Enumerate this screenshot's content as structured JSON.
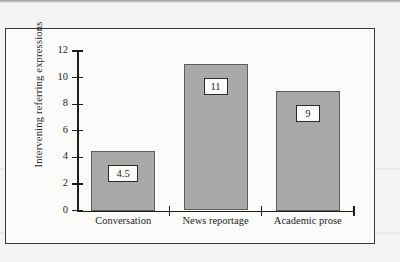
{
  "figure": {
    "colors": {
      "bar_fill": "#a9a9a7",
      "bar_edge": "#5d5d5b",
      "axis": "#1d1d1b",
      "frame": "#3a3a38",
      "plot_background": "#fbfbf9",
      "page_background": "#f4f4f2",
      "value_box_background": "#fdfdfb"
    }
  },
  "chart_data": {
    "type": "bar",
    "title": "",
    "subtitle": "",
    "xlabel": "",
    "ylabel": "Intervening referring expressions",
    "categories": [
      "Conversation",
      "News reportage",
      "Academic prose"
    ],
    "values": [
      4.5,
      11,
      9
    ],
    "value_labels": [
      "4.5",
      "11",
      "9"
    ],
    "ylim": [
      0,
      12
    ],
    "yticks": [
      0,
      2,
      4,
      6,
      8,
      10,
      12
    ],
    "ytick_labels": [
      "0",
      "2",
      "4",
      "6",
      "8",
      "10",
      "12"
    ],
    "grid": false,
    "legend": null,
    "annotations": []
  }
}
